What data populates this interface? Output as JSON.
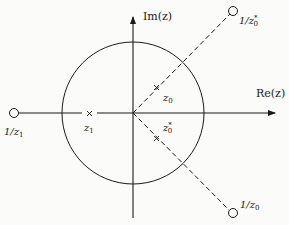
{
  "diagram": {
    "axes": {
      "re_label": "Re(z)",
      "im_label": "Im(z)"
    },
    "points": [
      {
        "name": "z0",
        "label": "z",
        "sub": "0",
        "sup": "",
        "type": "pole-x"
      },
      {
        "name": "z0-conj",
        "label": "z",
        "sub": "0",
        "sup": "*",
        "type": "pole-x"
      },
      {
        "name": "z1",
        "label": "z",
        "sub": "1",
        "sup": "",
        "type": "pole-x"
      },
      {
        "name": "inv-z0-conj",
        "label": "1/z",
        "sub": "0",
        "sup": "*",
        "type": "zero-o"
      },
      {
        "name": "inv-z0",
        "label": "1/z",
        "sub": "0",
        "sup": "",
        "type": "zero-o"
      },
      {
        "name": "inv-z1",
        "label": "1/z",
        "sub": "1",
        "sup": "",
        "type": "zero-o"
      }
    ],
    "unit_circle": "unit circle |z| = 1"
  },
  "colors": {
    "ink": "#1a1a1a",
    "background": "#fbfbf9"
  }
}
